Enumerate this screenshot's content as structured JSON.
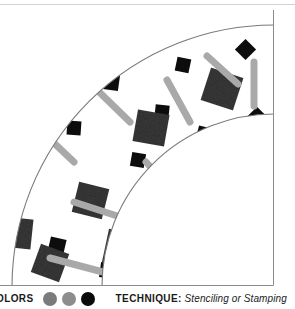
{
  "illustration": {
    "description": "quarter-annulus band filled with scattered tiles",
    "border_color": "#8c8c8c",
    "arc_color": "#7a7a7a",
    "background": "#ffffff",
    "shape_colors": {
      "large_square": "#3c3c3c",
      "small_diamond": "#0d0d0d",
      "bar": "#a9a9a9"
    },
    "shapes": [
      {
        "kind": "small-diamond",
        "x": 238,
        "y": 32,
        "size": 15,
        "rotate": 45
      },
      {
        "kind": "small-diamond",
        "x": 176,
        "y": 48,
        "size": 14,
        "rotate": 12
      },
      {
        "kind": "small-diamond",
        "x": 104,
        "y": 65,
        "size": 15,
        "rotate": 8
      },
      {
        "kind": "small-diamond",
        "x": 155,
        "y": 95,
        "size": 14,
        "rotate": 6
      },
      {
        "kind": "small-diamond",
        "x": 67,
        "y": 111,
        "size": 14,
        "rotate": 4
      },
      {
        "kind": "small-diamond",
        "x": 249,
        "y": 100,
        "size": 16,
        "rotate": 45
      },
      {
        "kind": "small-diamond",
        "x": 197,
        "y": 117,
        "size": 15,
        "rotate": 14
      },
      {
        "kind": "small-diamond",
        "x": 131,
        "y": 143,
        "size": 14,
        "rotate": 10
      },
      {
        "kind": "small-diamond",
        "x": 190,
        "y": 158,
        "size": 14,
        "rotate": 7
      },
      {
        "kind": "small-diamond",
        "x": 81,
        "y": 178,
        "size": 15,
        "rotate": 9
      },
      {
        "kind": "small-diamond",
        "x": 168,
        "y": 196,
        "size": 15,
        "rotate": 10
      },
      {
        "kind": "small-diamond",
        "x": 49,
        "y": 228,
        "size": 16,
        "rotate": 13
      },
      {
        "kind": "small-diamond",
        "x": 160,
        "y": 240,
        "size": 15,
        "rotate": 11
      },
      {
        "kind": "small-diamond",
        "x": 100,
        "y": 253,
        "size": 15,
        "rotate": 8
      },
      {
        "kind": "large-square",
        "x": 205,
        "y": 62,
        "size": 34,
        "rotate": 18
      },
      {
        "kind": "large-square",
        "x": 135,
        "y": 102,
        "size": 32,
        "rotate": 10
      },
      {
        "kind": "large-square",
        "x": 75,
        "y": 175,
        "size": 31,
        "rotate": 14
      },
      {
        "kind": "large-square",
        "x": 105,
        "y": 222,
        "size": 35,
        "rotate": 12
      },
      {
        "kind": "large-square",
        "x": 35,
        "y": 238,
        "size": 30,
        "rotate": 20
      },
      {
        "kind": "large-square",
        "x": 2,
        "y": 208,
        "size": 30,
        "rotate": 6
      },
      {
        "kind": "bar",
        "x1": 207,
        "y1": 46,
        "x2": 238,
        "y2": 74,
        "w": 7
      },
      {
        "kind": "bar",
        "x1": 254,
        "y1": 52,
        "x2": 254,
        "y2": 96,
        "w": 7
      },
      {
        "kind": "bar",
        "x1": 167,
        "y1": 70,
        "x2": 190,
        "y2": 112,
        "w": 7
      },
      {
        "kind": "bar",
        "x1": 95,
        "y1": 78,
        "x2": 130,
        "y2": 112,
        "w": 7
      },
      {
        "kind": "bar",
        "x1": 36,
        "y1": 116,
        "x2": 74,
        "y2": 152,
        "w": 7
      },
      {
        "kind": "bar",
        "x1": 146,
        "y1": 152,
        "x2": 176,
        "y2": 185,
        "w": 7
      },
      {
        "kind": "bar",
        "x1": 74,
        "y1": 192,
        "x2": 145,
        "y2": 215,
        "w": 7
      },
      {
        "kind": "bar",
        "x1": 50,
        "y1": 248,
        "x2": 118,
        "y2": 266,
        "w": 7
      }
    ]
  },
  "legend": {
    "colors_label": "OLORS",
    "swatches": [
      {
        "name": "swatch-gray",
        "color": "#7b7b7b"
      },
      {
        "name": "swatch-light-gray",
        "color": "#8d8d8d"
      },
      {
        "name": "swatch-black",
        "color": "#0b0b0b"
      }
    ],
    "technique_label": "TECHNIQUE:",
    "technique_value": "Stenciling or Stamping"
  }
}
